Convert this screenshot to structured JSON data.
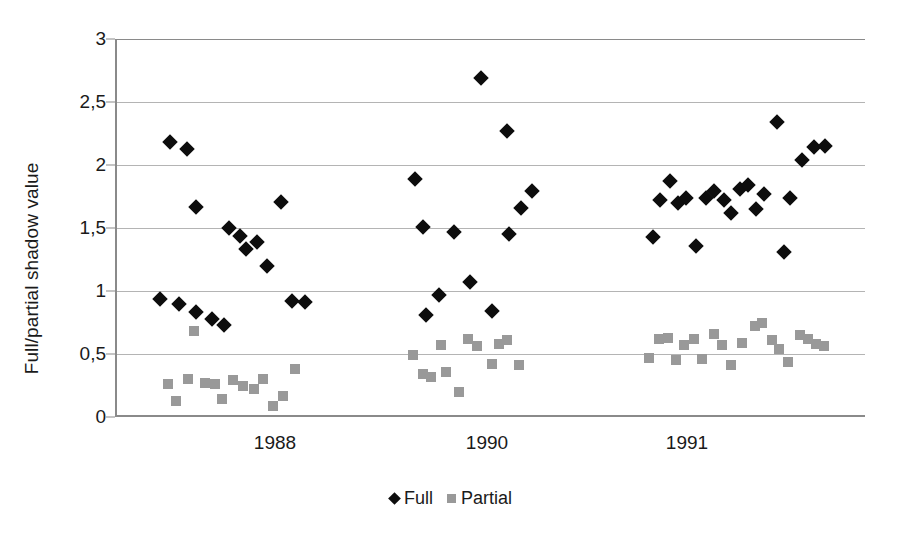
{
  "chart_data": {
    "type": "scatter",
    "title": "",
    "xlabel": "",
    "ylabel": "Full/partial shadow value",
    "ylim": [
      0,
      3
    ],
    "ytick_labels": [
      "0",
      "0,5",
      "1",
      "1,5",
      "2",
      "2,5",
      "3"
    ],
    "ytick_values": [
      0,
      0.5,
      1,
      1.5,
      2,
      2.5,
      3
    ],
    "xtick_labels": [
      "1988",
      "1990",
      "1991"
    ],
    "xtick_positions": [
      275,
      487,
      687
    ],
    "grid": true,
    "legend_position": "bottom",
    "legend": [
      {
        "name": "Full",
        "marker": "diamond",
        "color": "#0d0d0d"
      },
      {
        "name": "Partial",
        "marker": "square",
        "color": "#999999"
      }
    ],
    "series": [
      {
        "name": "Full",
        "marker": "diamond",
        "color": "#0d0d0d",
        "points": [
          {
            "x": 168,
            "y": 2.18
          },
          {
            "x": 185,
            "y": 2.13
          },
          {
            "x": 158,
            "y": 0.94
          },
          {
            "x": 177,
            "y": 0.9
          },
          {
            "x": 194,
            "y": 1.67
          },
          {
            "x": 194,
            "y": 0.83
          },
          {
            "x": 210,
            "y": 0.78
          },
          {
            "x": 222,
            "y": 0.73
          },
          {
            "x": 227,
            "y": 1.5
          },
          {
            "x": 238,
            "y": 1.44
          },
          {
            "x": 244,
            "y": 1.33
          },
          {
            "x": 255,
            "y": 1.39
          },
          {
            "x": 265,
            "y": 1.2
          },
          {
            "x": 279,
            "y": 1.71
          },
          {
            "x": 290,
            "y": 0.92
          },
          {
            "x": 303,
            "y": 0.91
          },
          {
            "x": 413,
            "y": 1.89
          },
          {
            "x": 421,
            "y": 1.51
          },
          {
            "x": 424,
            "y": 0.81
          },
          {
            "x": 437,
            "y": 0.97
          },
          {
            "x": 452,
            "y": 1.47
          },
          {
            "x": 468,
            "y": 1.07
          },
          {
            "x": 479,
            "y": 2.69
          },
          {
            "x": 490,
            "y": 0.84
          },
          {
            "x": 505,
            "y": 2.27
          },
          {
            "x": 507,
            "y": 1.45
          },
          {
            "x": 519,
            "y": 1.66
          },
          {
            "x": 530,
            "y": 1.79
          },
          {
            "x": 651,
            "y": 1.43
          },
          {
            "x": 658,
            "y": 1.72
          },
          {
            "x": 668,
            "y": 1.87
          },
          {
            "x": 676,
            "y": 1.7
          },
          {
            "x": 684,
            "y": 1.74
          },
          {
            "x": 694,
            "y": 1.36
          },
          {
            "x": 704,
            "y": 1.74
          },
          {
            "x": 712,
            "y": 1.79
          },
          {
            "x": 722,
            "y": 1.72
          },
          {
            "x": 729,
            "y": 1.62
          },
          {
            "x": 738,
            "y": 1.81
          },
          {
            "x": 746,
            "y": 1.84
          },
          {
            "x": 754,
            "y": 1.65
          },
          {
            "x": 762,
            "y": 1.77
          },
          {
            "x": 775,
            "y": 2.34
          },
          {
            "x": 782,
            "y": 1.31
          },
          {
            "x": 788,
            "y": 1.74
          },
          {
            "x": 800,
            "y": 2.04
          },
          {
            "x": 812,
            "y": 2.14
          },
          {
            "x": 823,
            "y": 2.15
          }
        ]
      },
      {
        "name": "Partial",
        "marker": "square",
        "color": "#999999",
        "points": [
          {
            "x": 166,
            "y": 0.26
          },
          {
            "x": 174,
            "y": 0.13
          },
          {
            "x": 186,
            "y": 0.3
          },
          {
            "x": 192,
            "y": 0.68
          },
          {
            "x": 203,
            "y": 0.27
          },
          {
            "x": 213,
            "y": 0.26
          },
          {
            "x": 220,
            "y": 0.14
          },
          {
            "x": 231,
            "y": 0.29
          },
          {
            "x": 241,
            "y": 0.25
          },
          {
            "x": 252,
            "y": 0.22
          },
          {
            "x": 261,
            "y": 0.3
          },
          {
            "x": 271,
            "y": 0.09
          },
          {
            "x": 281,
            "y": 0.17
          },
          {
            "x": 293,
            "y": 0.38
          },
          {
            "x": 411,
            "y": 0.49
          },
          {
            "x": 421,
            "y": 0.34
          },
          {
            "x": 429,
            "y": 0.32
          },
          {
            "x": 439,
            "y": 0.57
          },
          {
            "x": 444,
            "y": 0.36
          },
          {
            "x": 457,
            "y": 0.2
          },
          {
            "x": 466,
            "y": 0.62
          },
          {
            "x": 475,
            "y": 0.56
          },
          {
            "x": 490,
            "y": 0.42
          },
          {
            "x": 497,
            "y": 0.58
          },
          {
            "x": 505,
            "y": 0.61
          },
          {
            "x": 517,
            "y": 0.41
          },
          {
            "x": 647,
            "y": 0.47
          },
          {
            "x": 657,
            "y": 0.62
          },
          {
            "x": 666,
            "y": 0.63
          },
          {
            "x": 674,
            "y": 0.45
          },
          {
            "x": 682,
            "y": 0.57
          },
          {
            "x": 692,
            "y": 0.62
          },
          {
            "x": 700,
            "y": 0.46
          },
          {
            "x": 712,
            "y": 0.66
          },
          {
            "x": 720,
            "y": 0.57
          },
          {
            "x": 729,
            "y": 0.41
          },
          {
            "x": 740,
            "y": 0.59
          },
          {
            "x": 753,
            "y": 0.72
          },
          {
            "x": 760,
            "y": 0.75
          },
          {
            "x": 770,
            "y": 0.61
          },
          {
            "x": 777,
            "y": 0.54
          },
          {
            "x": 786,
            "y": 0.44
          },
          {
            "x": 798,
            "y": 0.65
          },
          {
            "x": 806,
            "y": 0.62
          },
          {
            "x": 814,
            "y": 0.58
          },
          {
            "x": 822,
            "y": 0.56
          }
        ]
      }
    ]
  }
}
